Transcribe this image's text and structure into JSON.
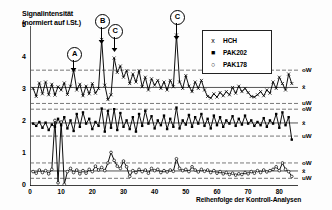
{
  "chart_data": {
    "type": "line",
    "title": "",
    "ylabel": "Signalintensität\n(normiert auf i.St.)",
    "ylabel_line1": "Signalintensität",
    "ylabel_line2": "(normiert auf i.St.)",
    "xlabel": "Reihenfolge der Kontroll-Analysen",
    "xlim": [
      0,
      86
    ],
    "ylim": [
      0,
      5
    ],
    "xticks": [
      0,
      10,
      20,
      30,
      40,
      50,
      60,
      70,
      80
    ],
    "yticks": [
      0,
      1,
      2,
      3,
      4,
      5
    ],
    "grid": false,
    "legend_position": "upper-right",
    "legend": [
      {
        "label": "HCH",
        "symbol": "x",
        "marker": "cross"
      },
      {
        "label": "PAK202",
        "symbol": "■",
        "marker": "filled-square"
      },
      {
        "label": "PAK178",
        "symbol": "○",
        "marker": "open-circle"
      }
    ],
    "control_limits": {
      "HCH": {
        "mean": 3.08,
        "upper_warning": 3.62,
        "lower_warning": 2.58,
        "mean_label": "x̄",
        "upper_label": "oW",
        "lower_label": "uW"
      },
      "PAK202": {
        "mean": 1.97,
        "upper_warning": 2.4,
        "lower_warning": 1.56,
        "mean_label": "x̄",
        "upper_label": "oW",
        "lower_label": "uW"
      },
      "PAK178": {
        "mean": 0.47,
        "upper_warning": 0.72,
        "lower_warning": 0.24,
        "mean_label": "x̄",
        "upper_label": "oW",
        "lower_label": "uW"
      }
    },
    "annotations": [
      {
        "label": "A",
        "x": 14,
        "series": "HCH",
        "note": "outlier above upper warning limit"
      },
      {
        "label": "B",
        "x": 23,
        "series": "HCH",
        "note": "large spike"
      },
      {
        "label": "C",
        "x": 27,
        "series": "HCH",
        "note": "spike"
      },
      {
        "label": "C",
        "x": 47,
        "series": "HCH",
        "note": "large spike"
      }
    ],
    "series": [
      {
        "name": "HCH",
        "marker": "cross",
        "x": [
          1,
          2,
          3,
          4,
          5,
          6,
          7,
          8,
          9,
          10,
          11,
          12,
          13,
          14,
          15,
          16,
          17,
          18,
          19,
          20,
          21,
          22,
          23,
          24,
          25,
          26,
          27,
          28,
          29,
          30,
          31,
          32,
          33,
          34,
          35,
          36,
          37,
          38,
          39,
          40,
          41,
          42,
          43,
          44,
          45,
          46,
          47,
          48,
          49,
          50,
          51,
          52,
          53,
          54,
          55,
          56,
          57,
          58,
          59,
          60,
          61,
          62,
          63,
          64,
          65,
          66,
          67,
          68,
          69,
          70,
          71,
          72,
          73,
          74,
          75,
          76,
          77,
          78,
          79,
          80,
          81,
          82,
          83,
          84
        ],
        "values": [
          3.05,
          2.8,
          3.22,
          2.88,
          3.25,
          2.85,
          3.18,
          2.84,
          3.1,
          3.0,
          3.22,
          2.86,
          3.12,
          3.62,
          3.0,
          3.18,
          2.82,
          3.12,
          2.88,
          3.2,
          2.9,
          3.05,
          4.58,
          3.15,
          2.7,
          2.85,
          4.0,
          3.55,
          3.75,
          3.4,
          3.6,
          3.2,
          3.5,
          3.25,
          3.6,
          3.1,
          3.4,
          3.0,
          3.35,
          3.15,
          3.3,
          3.05,
          3.25,
          3.0,
          3.3,
          3.1,
          4.72,
          3.25,
          3.05,
          3.45,
          3.12,
          2.95,
          3.25,
          3.05,
          3.3,
          3.0,
          2.8,
          2.75,
          2.88,
          2.78,
          2.92,
          2.82,
          2.95,
          2.85,
          3.08,
          2.9,
          3.12,
          2.95,
          3.05,
          2.92,
          2.8,
          2.78,
          2.85,
          2.95,
          2.82,
          3.0,
          2.9,
          3.25,
          3.05,
          3.4,
          3.2,
          3.0,
          3.5,
          3.2
        ]
      },
      {
        "name": "PAK202",
        "marker": "filled-square",
        "x": [
          1,
          2,
          3,
          4,
          5,
          6,
          7,
          8,
          9,
          10,
          11,
          12,
          13,
          14,
          15,
          16,
          17,
          18,
          19,
          20,
          21,
          22,
          23,
          24,
          25,
          26,
          27,
          28,
          29,
          30,
          31,
          32,
          33,
          34,
          35,
          36,
          37,
          38,
          39,
          40,
          41,
          42,
          43,
          44,
          45,
          46,
          47,
          48,
          49,
          50,
          51,
          52,
          53,
          54,
          55,
          56,
          57,
          58,
          59,
          60,
          61,
          62,
          63,
          64,
          65,
          66,
          67,
          68,
          69,
          70,
          71,
          72,
          73,
          74,
          75,
          76,
          77,
          78,
          79,
          80,
          81,
          82,
          83,
          84
        ],
        "values": [
          1.95,
          1.88,
          2.0,
          1.82,
          1.98,
          1.75,
          1.92,
          1.85,
          2.1,
          1.9,
          2.15,
          1.8,
          2.05,
          1.72,
          2.25,
          1.85,
          2.3,
          1.95,
          2.1,
          1.78,
          2.0,
          1.88,
          2.42,
          1.7,
          2.35,
          1.82,
          2.4,
          1.75,
          2.28,
          1.85,
          2.05,
          1.78,
          2.15,
          1.7,
          2.25,
          1.88,
          2.35,
          1.95,
          2.18,
          1.8,
          2.05,
          1.9,
          2.2,
          1.78,
          2.1,
          1.85,
          2.45,
          1.8,
          2.05,
          1.92,
          2.22,
          1.85,
          2.15,
          1.95,
          2.25,
          1.88,
          2.1,
          1.8,
          2.2,
          1.9,
          2.15,
          1.85,
          2.05,
          1.95,
          2.18,
          1.88,
          2.1,
          1.92,
          2.2,
          1.95,
          2.05,
          1.88,
          2.0,
          1.9,
          2.12,
          1.85,
          2.05,
          1.95,
          2.25,
          1.82,
          2.3,
          1.9,
          2.15,
          1.45
        ]
      },
      {
        "name": "PAK178",
        "marker": "open-circle",
        "x": [
          1,
          2,
          3,
          4,
          5,
          6,
          7,
          8,
          9,
          10,
          11,
          12,
          13,
          14,
          15,
          16,
          17,
          18,
          19,
          20,
          21,
          22,
          23,
          24,
          25,
          26,
          27,
          28,
          29,
          30,
          31,
          32,
          33,
          34,
          35,
          36,
          37,
          38,
          39,
          40,
          41,
          42,
          43,
          44,
          45,
          46,
          47,
          48,
          49,
          50,
          51,
          52,
          53,
          54,
          55,
          56,
          57,
          58,
          59,
          60,
          61,
          62,
          63,
          64,
          65,
          66,
          67,
          68,
          69,
          70,
          71,
          72,
          73,
          74,
          75,
          76,
          77,
          78,
          79,
          80,
          81,
          82,
          83,
          84
        ],
        "values": [
          0.45,
          0.4,
          0.5,
          0.42,
          0.48,
          0.38,
          0.52,
          2.05,
          0.1,
          2.0,
          0.05,
          0.45,
          0.55,
          0.42,
          0.5,
          0.38,
          0.48,
          0.4,
          0.52,
          0.45,
          0.62,
          0.5,
          0.58,
          0.48,
          0.72,
          1.05,
          0.8,
          0.62,
          0.55,
          0.78,
          0.6,
          0.3,
          0.48,
          0.42,
          0.52,
          0.45,
          0.5,
          0.4,
          0.55,
          0.48,
          0.52,
          0.42,
          0.48,
          0.44,
          0.5,
          0.46,
          0.85,
          0.55,
          0.48,
          0.52,
          0.45,
          0.6,
          0.5,
          0.44,
          0.52,
          0.46,
          0.5,
          0.42,
          0.48,
          0.4,
          0.45,
          0.38,
          0.42,
          0.36,
          0.4,
          0.34,
          0.38,
          0.36,
          0.42,
          0.38,
          0.45,
          0.4,
          0.48,
          0.42,
          0.5,
          0.44,
          0.48,
          0.52,
          0.6,
          0.48,
          0.72,
          0.52,
          0.45,
          0.3
        ]
      }
    ]
  },
  "colors": {
    "axis": "#000000",
    "series": "#000000",
    "mean_line": "#555555",
    "warning_line": "#555555"
  }
}
